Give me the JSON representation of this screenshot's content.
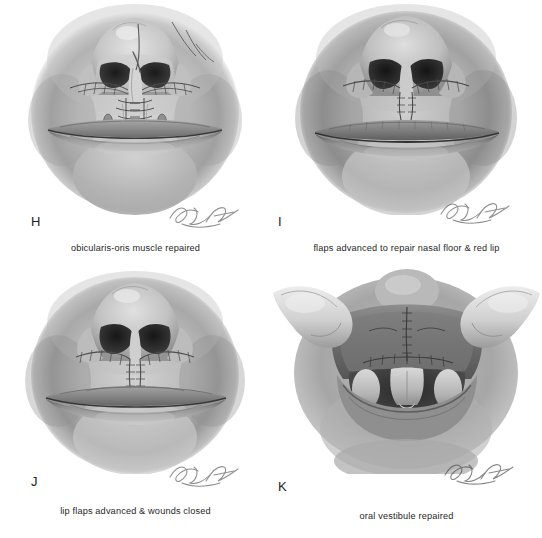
{
  "figure": {
    "background_color": "#ffffff",
    "ink_color": "#1f1f1f",
    "layout": "2x2 grid of grayscale medical illustrations"
  },
  "panels": [
    {
      "letter": "H",
      "caption": "obicularis-oris muscle repaired",
      "subject": "nose-and-lip-frontal-view-with-sutures-and-needle",
      "signature": "artist-signature"
    },
    {
      "letter": "I",
      "caption": "flaps advanced to repair nasal floor & red lip",
      "subject": "nose-and-lip-frontal-view-with-advanced-flaps",
      "signature": "artist-signature"
    },
    {
      "letter": "J",
      "caption": "lip flaps advanced & wounds closed",
      "subject": "nose-and-lip-frontal-view-closed-suture-line",
      "signature": "artist-signature"
    },
    {
      "letter": "K",
      "caption": "oral vestibule repaired",
      "subject": "retracted-upper-lip-showing-oral-vestibule-and-teeth",
      "signature": "artist-signature"
    }
  ]
}
